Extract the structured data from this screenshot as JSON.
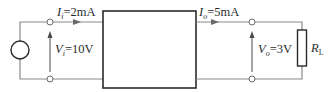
{
  "diagram": {
    "type": "two-port network circuit",
    "input": {
      "current_symbol": "I",
      "current_subscript": "i",
      "current_value": "=2mA",
      "voltage_symbol": "V",
      "voltage_subscript": "i",
      "voltage_value": "=10V",
      "source": "voltage-source"
    },
    "output": {
      "current_symbol": "I",
      "current_subscript": "o",
      "current_value": "=5mA",
      "voltage_symbol": "V",
      "voltage_subscript": "o",
      "voltage_value": "=3V"
    },
    "load": {
      "symbol": "R",
      "subscript": "L"
    },
    "block": "two-port-network-box"
  },
  "colors": {
    "wire": "#8a8a8a",
    "box": "#2a2a2a",
    "text": "#2a2a2a"
  }
}
